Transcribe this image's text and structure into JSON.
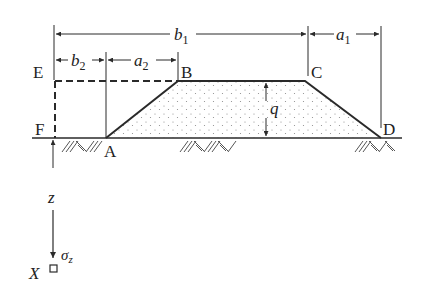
{
  "figure": {
    "points": {
      "E": "E",
      "F": "F",
      "A": "A",
      "B": "B",
      "C": "C",
      "D": "D",
      "X": "X"
    },
    "dimensions": {
      "b1": "b",
      "b1_sub": "1",
      "b2": "b",
      "b2_sub": "2",
      "a1": "a",
      "a1_sub": "1",
      "a2": "a",
      "a2_sub": "2",
      "q": "q",
      "z": "z",
      "sigma": "σ",
      "sigma_sub": "z"
    },
    "colors": {
      "line": "#2a2a2a",
      "fill_dots": "#9a9a9a",
      "hatch": "#555555"
    }
  }
}
